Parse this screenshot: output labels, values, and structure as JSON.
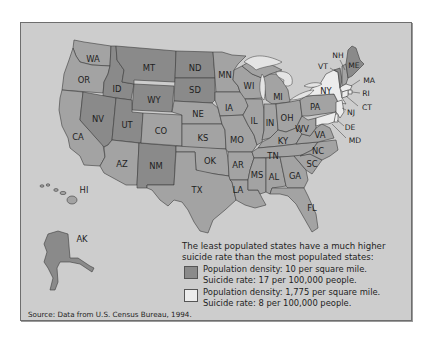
{
  "map": {
    "type": "choropleth",
    "region": "United States",
    "colors": {
      "background": "#cdcdcd",
      "least_populated": "#8a8a8a",
      "average": "#a3a3a3",
      "most_populated": "#ececec",
      "lakes": "#e4e4e4"
    },
    "states": [
      {
        "abbr": "WA",
        "class": "average"
      },
      {
        "abbr": "OR",
        "class": "average"
      },
      {
        "abbr": "CA",
        "class": "average"
      },
      {
        "abbr": "ID",
        "class": "least_populated"
      },
      {
        "abbr": "NV",
        "class": "least_populated"
      },
      {
        "abbr": "MT",
        "class": "least_populated"
      },
      {
        "abbr": "WY",
        "class": "least_populated"
      },
      {
        "abbr": "UT",
        "class": "least_populated"
      },
      {
        "abbr": "AZ",
        "class": "average"
      },
      {
        "abbr": "NM",
        "class": "least_populated"
      },
      {
        "abbr": "CO",
        "class": "average"
      },
      {
        "abbr": "ND",
        "class": "least_populated"
      },
      {
        "abbr": "SD",
        "class": "least_populated"
      },
      {
        "abbr": "NE",
        "class": "average"
      },
      {
        "abbr": "KS",
        "class": "average"
      },
      {
        "abbr": "OK",
        "class": "average"
      },
      {
        "abbr": "TX",
        "class": "average"
      },
      {
        "abbr": "MN",
        "class": "average"
      },
      {
        "abbr": "IA",
        "class": "average"
      },
      {
        "abbr": "MO",
        "class": "average"
      },
      {
        "abbr": "AR",
        "class": "average"
      },
      {
        "abbr": "LA",
        "class": "average"
      },
      {
        "abbr": "WI",
        "class": "average"
      },
      {
        "abbr": "IL",
        "class": "average"
      },
      {
        "abbr": "MI",
        "class": "average"
      },
      {
        "abbr": "IN",
        "class": "average"
      },
      {
        "abbr": "OH",
        "class": "average"
      },
      {
        "abbr": "KY",
        "class": "average"
      },
      {
        "abbr": "TN",
        "class": "average"
      },
      {
        "abbr": "MS",
        "class": "average"
      },
      {
        "abbr": "AL",
        "class": "average"
      },
      {
        "abbr": "GA",
        "class": "average"
      },
      {
        "abbr": "FL",
        "class": "average"
      },
      {
        "abbr": "SC",
        "class": "average"
      },
      {
        "abbr": "NC",
        "class": "average"
      },
      {
        "abbr": "VA",
        "class": "average"
      },
      {
        "abbr": "WV",
        "class": "average"
      },
      {
        "abbr": "PA",
        "class": "average"
      },
      {
        "abbr": "NY",
        "class": "most_populated"
      },
      {
        "abbr": "VT",
        "class": "least_populated"
      },
      {
        "abbr": "NH",
        "class": "average"
      },
      {
        "abbr": "ME",
        "class": "least_populated"
      },
      {
        "abbr": "MA",
        "class": "most_populated"
      },
      {
        "abbr": "RI",
        "class": "most_populated"
      },
      {
        "abbr": "CT",
        "class": "most_populated"
      },
      {
        "abbr": "NJ",
        "class": "most_populated"
      },
      {
        "abbr": "DE",
        "class": "most_populated"
      },
      {
        "abbr": "MD",
        "class": "most_populated"
      },
      {
        "abbr": "AK",
        "class": "least_populated"
      },
      {
        "abbr": "HI",
        "class": "average"
      }
    ],
    "labels": {
      "WA": "WA",
      "OR": "OR",
      "CA": "CA",
      "ID": "ID",
      "NV": "NV",
      "MT": "MT",
      "WY": "WY",
      "UT": "UT",
      "AZ": "AZ",
      "NM": "NM",
      "CO": "CO",
      "ND": "ND",
      "SD": "SD",
      "NE": "NE",
      "KS": "KS",
      "OK": "OK",
      "TX": "TX",
      "MN": "MN",
      "IA": "IA",
      "MO": "MO",
      "AR": "AR",
      "LA": "LA",
      "WI": "WI",
      "IL": "IL",
      "MI": "MI",
      "IN": "IN",
      "OH": "OH",
      "KY": "KY",
      "TN": "TN",
      "MS": "MS",
      "AL": "AL",
      "GA": "GA",
      "FL": "FL",
      "SC": "SC",
      "NC": "NC",
      "VA": "VA",
      "WV": "WV",
      "PA": "PA",
      "NY": "NY",
      "VT": "VT",
      "NH": "NH",
      "ME": "ME",
      "MA": "MA",
      "RI": "RI",
      "CT": "CT",
      "NJ": "NJ",
      "DE": "DE",
      "MD": "MD",
      "AK": "AK",
      "HI": "HI"
    }
  },
  "legend": {
    "title": "The least populated states have a much higher suicide rate than the most populated states:",
    "items": [
      {
        "swatch_color": "#8a8a8a",
        "line1": "Population density: 10 per square mile.",
        "line2": "Suicide rate: 17 per 100,000 people."
      },
      {
        "swatch_color": "#ececec",
        "line1": "Population density: 1,775 per square mile.",
        "line2": "Suicide rate: 8 per 100,000 people."
      }
    ]
  },
  "source": "Source: Data from U.S. Census Bureau, 1994."
}
